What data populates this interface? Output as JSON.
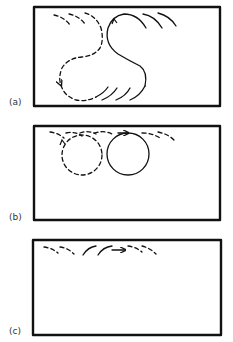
{
  "panels": [
    {
      "label": "(a)",
      "description": "S-shaped path: dashed loop then solid loop, with trailing arcs"
    },
    {
      "label": "(b)",
      "description": "Dashed circle and solid circle along top edge with arcs"
    },
    {
      "label": "(c)",
      "description": "Arcs along top edge with forward arrow"
    }
  ],
  "colors": {
    "stroke": "#111111",
    "background": "#ffffff",
    "label": "#333333"
  }
}
